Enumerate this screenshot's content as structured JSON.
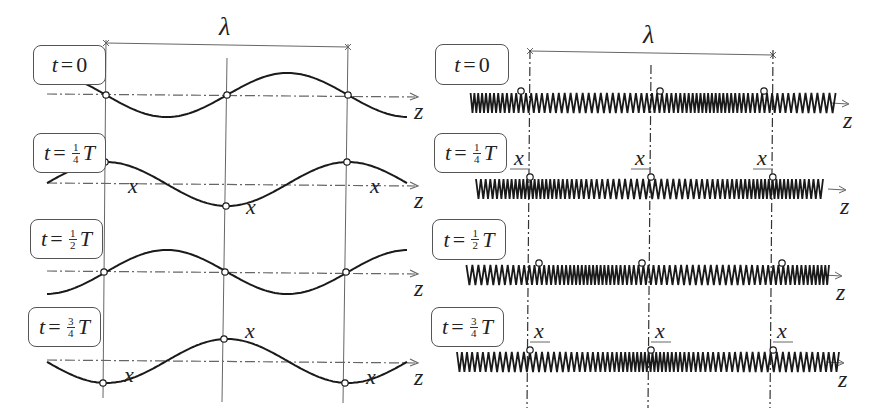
{
  "figure": {
    "left_panel": {
      "title": "Transverse wave snapshots",
      "wavelength_symbol": "λ",
      "axis_label": "z",
      "displacement_label": "x",
      "rows": [
        {
          "t_prefix": "t",
          "t_num": "",
          "t_den": "",
          "t_value": "0",
          "t_suffix": "",
          "phase": 0
        },
        {
          "t_prefix": "t",
          "t_num": "1",
          "t_den": "4",
          "t_value": "",
          "t_suffix": "T",
          "phase": 0.25
        },
        {
          "t_prefix": "t",
          "t_num": "1",
          "t_den": "2",
          "t_value": "",
          "t_suffix": "T",
          "phase": 0.5
        },
        {
          "t_prefix": "t",
          "t_num": "3",
          "t_den": "4",
          "t_value": "",
          "t_suffix": "T",
          "phase": 0.75
        }
      ]
    },
    "right_panel": {
      "title": "Longitudinal wave snapshots",
      "wavelength_symbol": "λ",
      "axis_label": "z",
      "displacement_label": "x",
      "rows": [
        {
          "t_prefix": "t",
          "t_num": "",
          "t_den": "",
          "t_value": "0",
          "t_suffix": "",
          "phase": 0
        },
        {
          "t_prefix": "t",
          "t_num": "1",
          "t_den": "4",
          "t_value": "",
          "t_suffix": "T",
          "phase": 0.25
        },
        {
          "t_prefix": "t",
          "t_num": "1",
          "t_den": "2",
          "t_value": "",
          "t_suffix": "T",
          "phase": 0.5
        },
        {
          "t_prefix": "t",
          "t_num": "3",
          "t_den": "4",
          "t_value": "",
          "t_suffix": "T",
          "phase": 0.75
        }
      ]
    },
    "colors": {
      "curve": "#1a1a1a",
      "guide": "#666666",
      "box_border": "#555555",
      "marker_fill": "#ffffff"
    }
  }
}
